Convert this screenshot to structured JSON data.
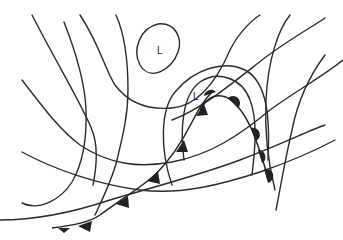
{
  "diagram": {
    "type": "weather-map",
    "colors": {
      "background": "#ffffff",
      "lines": "#2b2b2b",
      "symbols": "#222222"
    },
    "pressure_centers": [
      {
        "id": "low-1",
        "label": "L",
        "x": 160,
        "y": 50
      },
      {
        "id": "low-2",
        "label": "L",
        "x": 196,
        "y": 97
      }
    ],
    "fronts": [
      {
        "id": "cold-front",
        "type": "cold",
        "symbol": "triangles"
      },
      {
        "id": "warm-front",
        "type": "warm",
        "symbol": "semicircles"
      },
      {
        "id": "occluded-front",
        "type": "occluded",
        "symbol": "alternating"
      }
    ],
    "isobar_count": 11
  }
}
